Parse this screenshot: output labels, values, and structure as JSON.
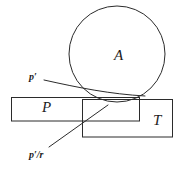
{
  "figure": {
    "background_color": "#ffffff",
    "stroke_color": "#2b2b2b",
    "text_color": "#1c1c1c",
    "width": 180,
    "height": 174,
    "shapes": {
      "circle": {
        "name": "A",
        "label": "A",
        "cx": 117,
        "cy": 54,
        "r": 48
      },
      "rect_p": {
        "name": "P",
        "label": "P",
        "x": 11,
        "y": 97,
        "width": 129,
        "height": 24
      },
      "rect_t": {
        "name": "T",
        "label": "T",
        "x": 82,
        "y": 99,
        "width": 91,
        "height": 38
      }
    },
    "annotations": [
      {
        "id": "p-prime",
        "base": "p",
        "prime": "′",
        "text": "p′",
        "label_x": 29,
        "label_y": 72,
        "leader": "M 44 80 L 100 92 L 145 96"
      },
      {
        "id": "p-prime-over-r",
        "base": "p",
        "prime": "′",
        "divider": "/",
        "denominator": "r",
        "text": "p′/r",
        "label_x": 29,
        "label_y": 150,
        "leader": "M 49 147 L 108 105"
      }
    ],
    "labels": {
      "circle_label_x": 114,
      "circle_label_y": 50,
      "rect_p_label_x": 42,
      "rect_p_label_y": 101,
      "rect_t_label_x": 153,
      "rect_t_label_y": 114
    }
  }
}
